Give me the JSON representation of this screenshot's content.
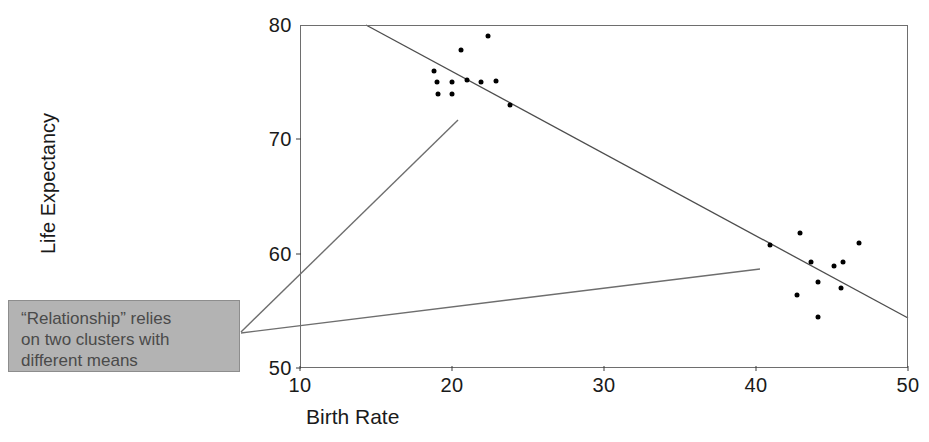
{
  "chart_data": {
    "type": "scatter",
    "title": "",
    "xlabel": "Birth Rate",
    "ylabel": "Life Expectancy",
    "xlim": [
      10,
      50
    ],
    "ylim": [
      50,
      80
    ],
    "xticks": [
      10,
      20,
      30,
      40,
      50
    ],
    "yticks": [
      50,
      60,
      70,
      80
    ],
    "grid": false,
    "legend": null,
    "series": [
      {
        "name": "Countries",
        "points": [
          {
            "x": 18.8,
            "y": 76.0
          },
          {
            "x": 19.0,
            "y": 75.0
          },
          {
            "x": 19.1,
            "y": 74.0
          },
          {
            "x": 20.0,
            "y": 75.0
          },
          {
            "x": 20.0,
            "y": 74.0
          },
          {
            "x": 20.6,
            "y": 77.8
          },
          {
            "x": 21.0,
            "y": 75.2
          },
          {
            "x": 21.9,
            "y": 75.0
          },
          {
            "x": 22.4,
            "y": 79.0
          },
          {
            "x": 22.9,
            "y": 75.1
          },
          {
            "x": 23.8,
            "y": 73.0
          },
          {
            "x": 40.9,
            "y": 60.8
          },
          {
            "x": 42.9,
            "y": 61.8
          },
          {
            "x": 42.7,
            "y": 56.4
          },
          {
            "x": 43.6,
            "y": 59.3
          },
          {
            "x": 44.1,
            "y": 57.5
          },
          {
            "x": 44.1,
            "y": 54.5
          },
          {
            "x": 45.1,
            "y": 58.9
          },
          {
            "x": 45.7,
            "y": 59.3
          },
          {
            "x": 45.6,
            "y": 57.0
          },
          {
            "x": 46.8,
            "y": 60.9
          }
        ]
      }
    ],
    "trend_line": {
      "name": "fitted regression line",
      "x_start": 14.3,
      "y_start": 80.0,
      "x_end": 50.0,
      "y_end": 54.4
    },
    "annotation": {
      "lines": [
        "“Relationship” relies",
        "on two clusters with",
        "different means"
      ],
      "box_color": "#b3b3b3",
      "text_color": "#4a4a4a"
    }
  },
  "axes": {
    "y_tick_labels": [
      "80",
      "70",
      "60",
      "50"
    ],
    "x_tick_labels": [
      "10",
      "20",
      "30",
      "40",
      "50"
    ],
    "y_axis_title": "Life Expectancy",
    "x_axis_title": "Birth Rate"
  },
  "colors": {
    "point": "#000000",
    "frame": "#6e6e6e",
    "trend": "#4d4d4d",
    "pointer": "#6e6e6e"
  }
}
